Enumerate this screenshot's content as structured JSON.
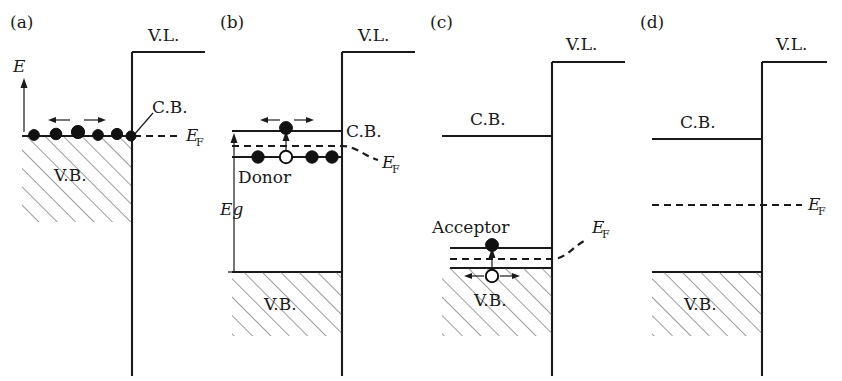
{
  "figure": {
    "type": "diagram",
    "background": "#ffffff",
    "ink_color": "#1a1a1a",
    "panel_count": 4
  },
  "panels": [
    {
      "id": "a",
      "caption": "(a)",
      "description": "Metal / degenerate case: filled valence band with mobile electrons at the Fermi level, C.B. touching E_F",
      "axis": {
        "label": "E",
        "direction": "up"
      },
      "labels": {
        "vacuum_level": "V.L.",
        "conduction_band": "C.B.",
        "valence_band": "V.B.",
        "fermi_level": "E",
        "fermi_subscript": "F"
      },
      "electrons": {
        "count": 6,
        "filled": 6,
        "open": 0
      },
      "motion_arrows": [
        "left",
        "right"
      ],
      "fermi_style": "flat-dashed",
      "has_band_gap_arrow": false
    },
    {
      "id": "b",
      "caption": "(b)",
      "description": "n-type semiconductor: donor level just below C.B., one donor ionized, electron promoted into C.B.",
      "labels": {
        "vacuum_level": "V.L.",
        "conduction_band": "C.B.",
        "valence_band": "V.B.",
        "donor": "Donor",
        "band_gap": "Eg",
        "fermi_level": "E",
        "fermi_subscript": "F"
      },
      "conduction_electrons": {
        "count": 1,
        "filled": 1
      },
      "donor_sites": [
        "filled",
        "open",
        "filled",
        "filled"
      ],
      "motion_arrows": [
        "left",
        "right"
      ],
      "promotion_arrow": "up",
      "fermi_style": "curve-down-at-surface",
      "has_band_gap_arrow": true
    },
    {
      "id": "c",
      "caption": "(c)",
      "description": "p-type semiconductor: acceptor level just above V.B., electron captured from V.B. leaving a mobile hole",
      "labels": {
        "vacuum_level": "V.L.",
        "conduction_band": "C.B.",
        "valence_band": "V.B.",
        "acceptor": "Acceptor",
        "fermi_level": "E",
        "fermi_subscript": "F"
      },
      "acceptor_sites": [
        "filled"
      ],
      "holes": {
        "count": 1,
        "open": 1
      },
      "motion_arrows": [
        "left",
        "right"
      ],
      "promotion_arrow": "up",
      "fermi_style": "curve-up-at-surface",
      "has_band_gap_arrow": false
    },
    {
      "id": "d",
      "caption": "(d)",
      "description": "Intrinsic semiconductor: Fermi level flat at mid-gap, no dopant levels, no carriers shown",
      "labels": {
        "vacuum_level": "V.L.",
        "conduction_band": "C.B.",
        "valence_band": "V.B.",
        "fermi_level": "E",
        "fermi_subscript": "F"
      },
      "carriers": {
        "count": 0
      },
      "fermi_style": "flat-dashed-midgap",
      "has_band_gap_arrow": false
    }
  ]
}
